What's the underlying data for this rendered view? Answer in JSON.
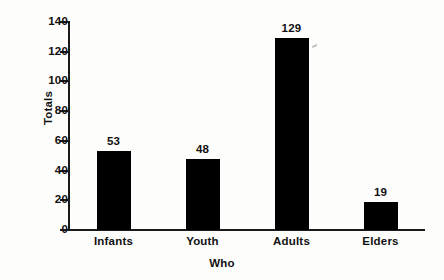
{
  "chart_data": {
    "type": "bar",
    "title": "",
    "xlabel": "Who",
    "ylabel": "Totals",
    "categories": [
      "Infants",
      "Youth",
      "Adults",
      "Elders"
    ],
    "values": [
      53,
      48,
      129,
      19
    ],
    "value_labels": [
      "53",
      "48",
      "129",
      "19"
    ],
    "ylim": [
      0,
      140
    ],
    "yticks": [
      0,
      20,
      40,
      60,
      80,
      100,
      120,
      140
    ],
    "ytick_labels": [
      "0",
      "20",
      "40",
      "60",
      "80",
      "100",
      "120",
      "140"
    ],
    "grid": false,
    "legend": false,
    "legend_position": "none",
    "bar_color": "#000000",
    "background_color": "#fdfdfc",
    "axis_color": "#1a1a1a"
  }
}
